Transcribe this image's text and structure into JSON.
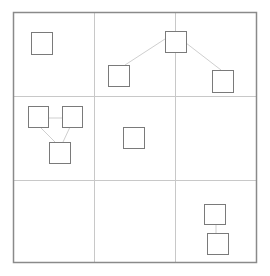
{
  "diagram": {
    "colors": {
      "background": "#ffffff",
      "outer_border": "#8a8a8a",
      "grid_line": "#c8c8c8",
      "box_stroke": "#7a7a7a",
      "connector": "#cfcfcf"
    },
    "outer_frame": {
      "x": 13,
      "y": 12,
      "w": 243,
      "h": 250
    },
    "grid": {
      "vertical_lines": [
        94,
        175
      ],
      "horizontal_lines": [
        96,
        180
      ]
    },
    "nodes": [
      {
        "id": "n1",
        "cell": "r1c1",
        "x": 31,
        "y": 32,
        "w": 21,
        "h": 22
      },
      {
        "id": "n2",
        "cell": "r1c2-c3",
        "x": 165,
        "y": 31,
        "w": 21,
        "h": 21
      },
      {
        "id": "n3",
        "cell": "r1c2",
        "x": 108,
        "y": 65,
        "w": 21,
        "h": 21
      },
      {
        "id": "n4",
        "cell": "r1c3",
        "x": 212,
        "y": 70,
        "w": 21,
        "h": 22
      },
      {
        "id": "n5",
        "cell": "r2c1",
        "x": 28,
        "y": 106,
        "w": 20,
        "h": 21
      },
      {
        "id": "n6",
        "cell": "r2c1",
        "x": 62,
        "y": 106,
        "w": 20,
        "h": 21
      },
      {
        "id": "n7",
        "cell": "r2c1",
        "x": 49,
        "y": 142,
        "w": 21,
        "h": 21
      },
      {
        "id": "n8",
        "cell": "r2c2",
        "x": 123,
        "y": 127,
        "w": 21,
        "h": 21
      },
      {
        "id": "n9",
        "cell": "r3c3",
        "x": 204,
        "y": 204,
        "w": 21,
        "h": 20
      },
      {
        "id": "n10",
        "cell": "r3c3",
        "x": 207,
        "y": 233,
        "w": 21,
        "h": 21
      }
    ],
    "edges": [
      {
        "from": "n2",
        "to": "n3",
        "x1": 165,
        "y1": 39,
        "x2": 125,
        "y2": 65
      },
      {
        "from": "n2",
        "to": "n4",
        "x1": 186,
        "y1": 43,
        "x2": 221,
        "y2": 70
      },
      {
        "from": "n5",
        "to": "n6",
        "x1": 48,
        "y1": 118,
        "x2": 62,
        "y2": 118
      },
      {
        "from": "n5",
        "to": "n7",
        "x1": 40,
        "y1": 127,
        "x2": 55,
        "y2": 142
      },
      {
        "from": "n6",
        "to": "n7",
        "x1": 70,
        "y1": 127,
        "x2": 63,
        "y2": 142
      },
      {
        "from": "n9",
        "to": "n10",
        "x1": 216,
        "y1": 224,
        "x2": 216,
        "y2": 233
      }
    ]
  }
}
